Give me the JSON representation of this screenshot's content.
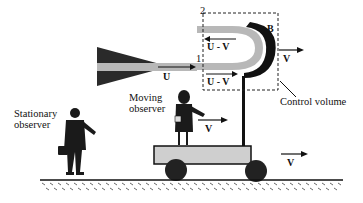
{
  "diagram": {
    "type": "physics-schematic",
    "labels": {
      "station_2": "2",
      "station_1": "1",
      "vane": "B",
      "jet_velocity": "U",
      "relative_velocity_top": "U - V",
      "relative_velocity_bottom": "U - V",
      "cv_velocity": "V",
      "control_volume": "Control volume",
      "moving_observer_line1": "Moving",
      "moving_observer_line2": "observer",
      "moving_observer_velocity": "V",
      "stationary_observer_line1": "Stationary",
      "stationary_observer_line2": "observer",
      "cart_velocity": "V"
    },
    "colors": {
      "ink": "#111111",
      "jet_fill": "#b8b8b8",
      "nozzle": "#2a2a2a",
      "cart_fill": "#cfcfcf",
      "ground_hatch": "#444444",
      "background": "#ffffff"
    }
  }
}
